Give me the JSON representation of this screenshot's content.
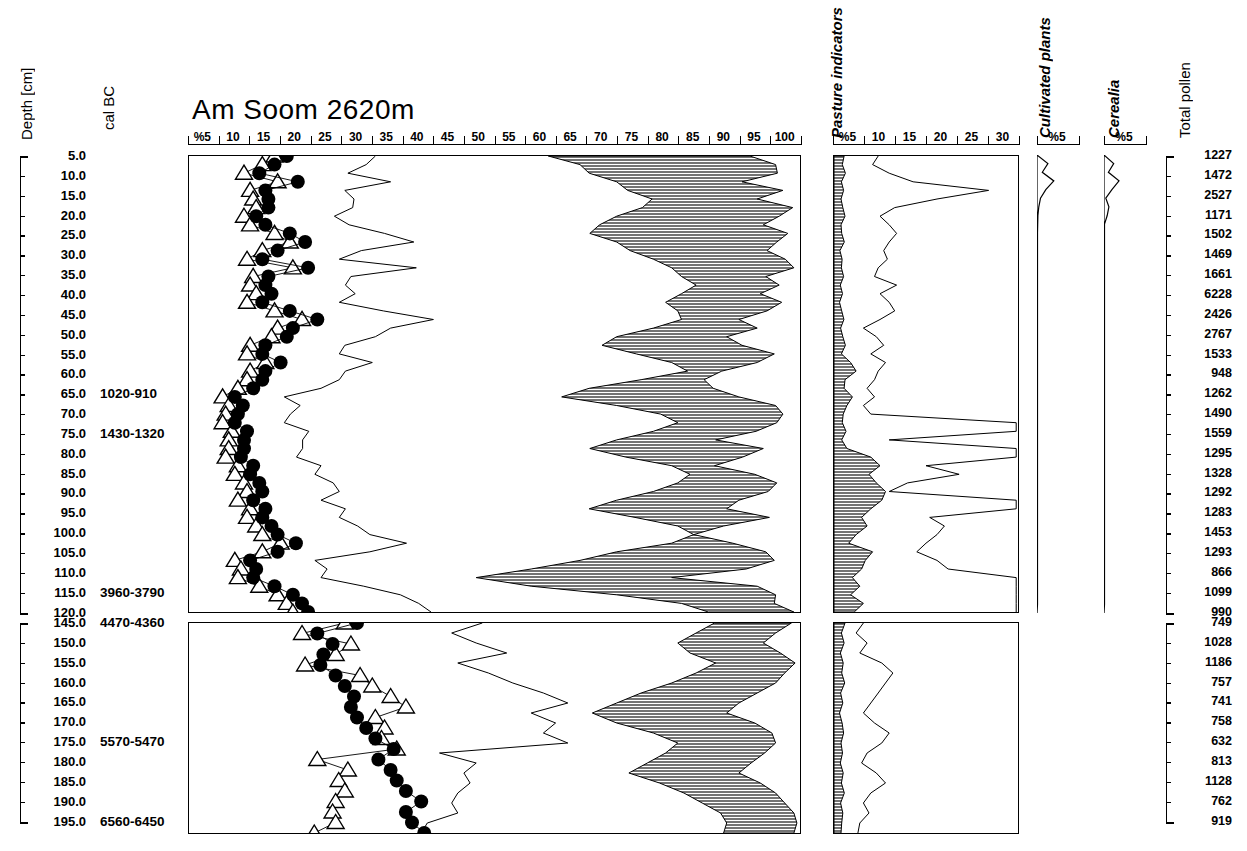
{
  "chart_data": {
    "type": "area",
    "title": "Am Soom   2620m",
    "subtitle": "",
    "xlabel": "",
    "ylabel": "Depth [cm]",
    "grid": false,
    "legend": "none",
    "axes": {
      "depth_label": "Depth [cm]",
      "calbc_label": "cal BC",
      "total_label": "Total pollen",
      "main_axis_ticks": [
        "%5",
        "10",
        "15",
        "20",
        "25",
        "30",
        "35",
        "40",
        "45",
        "50",
        "55",
        "60",
        "65",
        "70",
        "75",
        "80",
        "85",
        "90",
        "95",
        "100"
      ],
      "pasture_axis_ticks": [
        "%5",
        "10",
        "15",
        "20",
        "25",
        "30"
      ],
      "cultivated_axis_ticks": [
        "%5"
      ],
      "cerealia_axis_ticks": [
        "%5"
      ],
      "main_xlim": [
        0,
        100
      ],
      "pasture_xlim": [
        0,
        30
      ],
      "cultivated_xlim": [
        0,
        5
      ],
      "cerealia_xlim": [
        0,
        5
      ],
      "depth_top_range": [
        5.0,
        120.0
      ],
      "depth_bottom_range": [
        145.0,
        195.0
      ]
    },
    "columns": {
      "pasture_indicators": "Pasture indicators",
      "cultivated_plants": "Cultivated plants",
      "cerealia": "Cerealia",
      "total_pollen": "Total pollen"
    },
    "depths_top": [
      "5.0",
      "10.0",
      "15.0",
      "20.0",
      "25.0",
      "30.0",
      "35.0",
      "40.0",
      "45.0",
      "50.0",
      "55.0",
      "60.0",
      "65.0",
      "70.0",
      "75.0",
      "80.0",
      "85.0",
      "90.0",
      "95.0",
      "100.0",
      "105.0",
      "110.0",
      "115.0",
      "120.0"
    ],
    "depths_bottom": [
      "145.0",
      "150.0",
      "155.0",
      "160.0",
      "165.0",
      "170.0",
      "175.0",
      "180.0",
      "185.0",
      "190.0",
      "195.0"
    ],
    "total_pollen_top": [
      "1227",
      "1472",
      "2527",
      "1171",
      "1502",
      "1469",
      "1661",
      "6228",
      "2426",
      "2767",
      "1533",
      "948",
      "1262",
      "1490",
      "1559",
      "1295",
      "1328",
      "1292",
      "1283",
      "1453",
      "1293",
      "866",
      "1099",
      "990"
    ],
    "total_pollen_bottom": [
      "749",
      "1028",
      "1186",
      "757",
      "741",
      "758",
      "632",
      "813",
      "1128",
      "762",
      "919"
    ],
    "cal_bc_top": [
      {
        "depth": "65.0",
        "value": "1020-910"
      },
      {
        "depth": "75.0",
        "value": "1430-1320"
      },
      {
        "depth": "115.0",
        "value": "3960-3790"
      }
    ],
    "cal_bc_bottom": [
      {
        "depth": "145.0",
        "value": "4470-4360"
      },
      {
        "depth": "175.0",
        "value": "5570-5470"
      },
      {
        "depth": "195.0",
        "value": "6560-6450"
      }
    ],
    "series": [
      {
        "name": "circles-top",
        "symbol": "filled-circle",
        "panel": "main",
        "values": [
          16.0,
          14.0,
          11.5,
          17.8,
          12.5,
          13.0,
          13.0,
          11.0,
          12.5,
          16.5,
          19.0,
          14.5,
          12.0,
          19.5,
          13.0,
          12.5,
          13.5,
          12.0,
          16.5,
          21.0,
          17.0,
          16.0,
          12.5,
          12.0,
          15.0,
          12.5,
          12.0,
          10.5,
          7.5,
          8.8,
          8.0,
          7.5,
          9.5,
          9.0,
          9.0,
          8.5,
          10.5,
          10.0,
          11.5,
          12.0,
          10.5,
          12.5,
          12.0,
          13.5,
          14.5,
          17.5,
          14.5,
          10.0,
          11.0,
          10.5,
          14.0,
          17.0,
          18.5,
          19.5
        ]
      },
      {
        "name": "triangles-top",
        "symbol": "open-triangle",
        "panel": "main",
        "values": [
          14.0,
          12.0,
          9.0,
          14.5,
          10.0,
          10.5,
          11.0,
          9.0,
          10.0,
          14.0,
          16.5,
          12.0,
          9.5,
          17.0,
          10.5,
          10.0,
          11.0,
          9.5,
          14.0,
          18.5,
          14.5,
          13.5,
          10.0,
          9.5,
          12.5,
          10.0,
          9.5,
          8.0,
          5.5,
          6.5,
          6.0,
          5.5,
          7.0,
          6.5,
          6.5,
          6.0,
          8.0,
          7.5,
          9.0,
          9.5,
          8.0,
          10.0,
          9.5,
          11.0,
          12.0,
          15.0,
          12.0,
          7.5,
          8.5,
          8.0,
          11.5,
          14.5,
          16.0,
          17.0
        ]
      },
      {
        "name": "circles-bottom",
        "symbol": "filled-circle",
        "panel": "lower",
        "values": [
          27.5,
          21.0,
          23.5,
          22.0,
          21.5,
          24.0,
          25.5,
          27.0,
          26.5,
          27.5,
          29.0,
          30.5,
          33.5,
          31.0,
          33.0,
          34.0,
          35.5,
          38.0,
          35.5,
          36.5,
          38.5
        ]
      },
      {
        "name": "triangles-bottom",
        "symbol": "open-triangle",
        "panel": "lower",
        "values": [
          25.5,
          18.5,
          26.5,
          24.0,
          19.0,
          28.0,
          30.0,
          33.0,
          35.5,
          30.5,
          32.0,
          31.5,
          34.0,
          21.0,
          26.0,
          24.5,
          25.5,
          24.0,
          23.5,
          24.0,
          20.5
        ]
      }
    ]
  },
  "header": {
    "title": "Am Soom   2620m",
    "depth_label": "Depth [cm]",
    "cal_bc_label": "cal BC",
    "pasture_label": "Pasture indicators",
    "cultivated_label": "Cultivated plants",
    "cerealia_label": "Cerealia",
    "total_pollen_label": "Total pollen"
  }
}
